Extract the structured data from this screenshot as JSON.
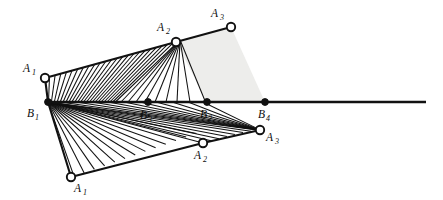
{
  "figure": {
    "name": "geometric-construction-diagram",
    "background_color": "#ffffff",
    "stroke_color": "#111111",
    "shade_color": "#ededeb",
    "width": 443,
    "height": 200
  },
  "axis": {
    "name": "horizontal-baseline",
    "x_start": 48,
    "x_end": 426,
    "y": 102
  },
  "points": {
    "upper_A1": {
      "label": "A",
      "sub": "1",
      "x": 45,
      "y": 78,
      "marker": "open-circle",
      "label_x": 23,
      "label_y": 72
    },
    "upper_A2": {
      "label": "A",
      "sub": "2",
      "x": 176,
      "y": 42,
      "marker": "open-circle",
      "label_x": 157,
      "label_y": 31
    },
    "upper_A3": {
      "label": "A",
      "sub": "3",
      "x": 231,
      "y": 27,
      "marker": "open-circle",
      "label_x": 211,
      "label_y": 17
    },
    "lower_A1": {
      "label": "A",
      "sub": "1",
      "x": 71,
      "y": 177,
      "marker": "open-circle",
      "label_x": 74,
      "label_y": 191
    },
    "lower_A2": {
      "label": "A",
      "sub": "2",
      "x": 203,
      "y": 143,
      "marker": "open-circle",
      "label_x": 194,
      "label_y": 158
    },
    "lower_A3": {
      "label": "A",
      "sub": "3",
      "x": 260,
      "y": 130,
      "marker": "open-circle",
      "label_x": 266,
      "label_y": 140
    },
    "B1": {
      "label": "B",
      "sub": "1",
      "x": 48,
      "y": 102,
      "marker": "filled-dot",
      "label_x": 27,
      "label_y": 116
    },
    "B2": {
      "label": "B",
      "sub": "2",
      "x": 207,
      "y": 102,
      "marker": "filled-dot",
      "label_x": 200,
      "label_y": 117
    },
    "B3": {
      "label": "B",
      "sub": "3",
      "x": 148,
      "y": 102,
      "marker": "filled-dot",
      "label_x": 140,
      "label_y": 118
    },
    "B4": {
      "label": "B",
      "sub": "4",
      "x": 265,
      "y": 102,
      "marker": "filled-dot",
      "label_x": 258,
      "label_y": 117
    }
  },
  "segments": {
    "upper_chain": "A1(45,78) - A2(176,42) - A3(231,27)",
    "lower_chain": "A1(71,177) - A2(203,143) - A3(260,130)",
    "upper_left_edge": "A1(45,78) - B1(48,102)",
    "lower_left_edge": "B1(48,102) - A1(71,177)"
  },
  "hatching": {
    "upper_region": {
      "name": "upper-parallel-hatching",
      "description": "parallel lines from the A1-A2-A3 chain down to the baseline",
      "count": 24,
      "style": "parallel"
    },
    "lower_region": {
      "name": "lower-fan-hatching",
      "description": "fan of lines radiating from B1 toward the lower A1-A2-A3 chain",
      "count": 26,
      "style": "fan"
    }
  },
  "shaded_region": {
    "name": "shaded-quadrilateral",
    "vertices": "A2(176,42) - A3(231,27) - B4(265,102) - B2(207,102)",
    "fill": "#ededeb"
  }
}
